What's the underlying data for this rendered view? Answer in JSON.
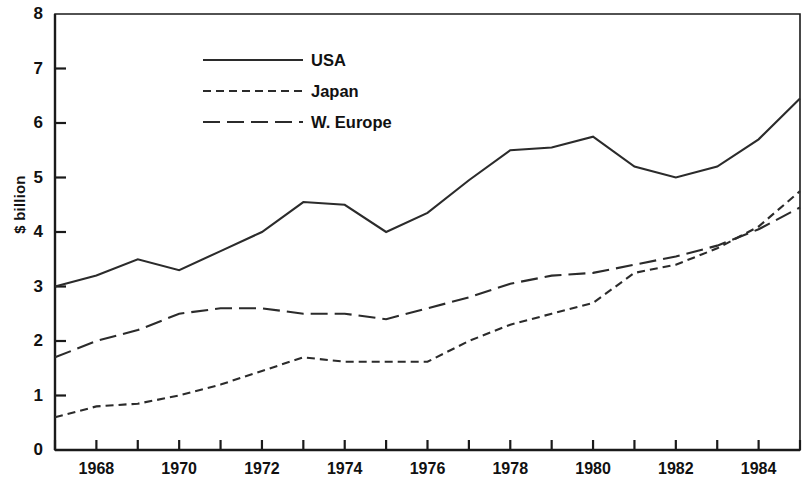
{
  "chart_data": {
    "type": "line",
    "title": "",
    "xlabel": "",
    "ylabel": "$ billion",
    "xlim": [
      1967,
      1985
    ],
    "ylim": [
      0,
      8
    ],
    "grid": false,
    "legend_position": "top-center",
    "y_ticks": [
      0,
      1,
      2,
      3,
      4,
      5,
      6,
      7,
      8
    ],
    "y_tick_labels": [
      "0",
      "1",
      "2",
      "3",
      "4",
      "5",
      "6",
      "7",
      "8"
    ],
    "x_ticks": [
      1967,
      1968,
      1969,
      1970,
      1971,
      1972,
      1973,
      1974,
      1975,
      1976,
      1977,
      1978,
      1979,
      1980,
      1981,
      1982,
      1983,
      1984,
      1985
    ],
    "x_tick_labels_shown": [
      "1968",
      "1970",
      "1972",
      "1974",
      "1976",
      "1978",
      "1980",
      "1982",
      "1984"
    ],
    "x": [
      1967,
      1968,
      1969,
      1970,
      1971,
      1972,
      1973,
      1974,
      1975,
      1976,
      1977,
      1978,
      1979,
      1980,
      1981,
      1982,
      1983,
      1984,
      1985
    ],
    "series": [
      {
        "name": "USA",
        "style": "solid",
        "values": [
          3.0,
          3.2,
          3.5,
          3.3,
          3.65,
          4.0,
          4.55,
          4.5,
          4.0,
          4.35,
          4.95,
          5.5,
          5.55,
          5.75,
          5.2,
          5.0,
          5.2,
          5.7,
          6.45
        ]
      },
      {
        "name": "Japan",
        "style": "dashed-short",
        "values": [
          0.6,
          0.8,
          0.85,
          1.0,
          1.2,
          1.45,
          1.7,
          1.62,
          1.62,
          1.62,
          2.0,
          2.3,
          2.5,
          2.7,
          3.25,
          3.4,
          3.7,
          4.1,
          4.75
        ]
      },
      {
        "name": "W. Europe",
        "style": "dashed-long",
        "values": [
          1.7,
          2.0,
          2.2,
          2.5,
          2.6,
          2.6,
          2.5,
          2.5,
          2.4,
          2.6,
          2.8,
          3.05,
          3.2,
          3.25,
          3.4,
          3.55,
          3.75,
          4.05,
          4.45
        ]
      }
    ]
  },
  "legend": {
    "items": [
      {
        "label": "USA"
      },
      {
        "label": "Japan"
      },
      {
        "label": "W. Europe"
      }
    ]
  }
}
